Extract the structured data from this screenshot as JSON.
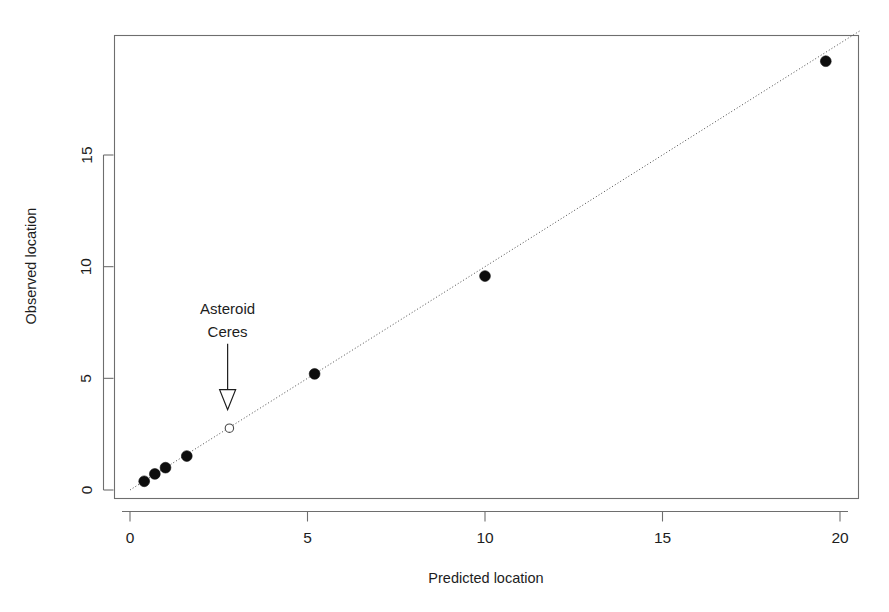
{
  "chart_data": {
    "type": "scatter",
    "title": "",
    "xlabel": "Predicted location",
    "ylabel": "Observed location",
    "xlim": [
      -0.35,
      21.2
    ],
    "ylim": [
      -0.45,
      20.6
    ],
    "xticks": [
      0,
      5,
      10,
      15,
      20
    ],
    "xtick_labels": [
      "0",
      "5",
      "10",
      "15",
      "20"
    ],
    "yticks": [
      0,
      5,
      10,
      15
    ],
    "ytick_labels": [
      "0",
      "5",
      "10",
      "15"
    ],
    "grid": false,
    "legend": null,
    "points": [
      {
        "name": "Mercury",
        "x": 0.4,
        "y": 0.39,
        "marker": "filled-circle"
      },
      {
        "name": "Venus",
        "x": 0.7,
        "y": 0.72,
        "marker": "filled-circle"
      },
      {
        "name": "Earth",
        "x": 1.0,
        "y": 1.0,
        "marker": "filled-circle"
      },
      {
        "name": "Mars",
        "x": 1.6,
        "y": 1.52,
        "marker": "filled-circle"
      },
      {
        "name": "Ceres",
        "x": 2.8,
        "y": 2.77,
        "marker": "open-circle"
      },
      {
        "name": "Jupiter",
        "x": 5.2,
        "y": 5.2,
        "marker": "filled-circle"
      },
      {
        "name": "Saturn",
        "x": 10.0,
        "y": 9.58,
        "marker": "filled-circle"
      },
      {
        "name": "Uranus",
        "x": 19.6,
        "y": 19.2,
        "marker": "filled-circle"
      }
    ],
    "reference_line": {
      "type": "identity",
      "style": "dotted",
      "from": [
        0,
        0
      ],
      "to": [
        20.6,
        20.6
      ]
    },
    "annotations": [
      {
        "id": "ceres-annotation",
        "text_lines": [
          "Asteroid",
          "Ceres"
        ],
        "text_x": 2.75,
        "text_y": 7.9,
        "arrow_from": [
          2.75,
          6.55
        ],
        "arrow_to": [
          2.75,
          3.6
        ],
        "arrow_style": "open-head-down"
      }
    ],
    "colors": {
      "point_filled": "#0d0d0d",
      "point_open_stroke": "#4a4a4a",
      "point_open_fill": "#ffffff",
      "reference_line": "#4a4a4a",
      "axis": "#6e6e6e",
      "text": "#1d1d1d",
      "background": "#ffffff"
    }
  }
}
